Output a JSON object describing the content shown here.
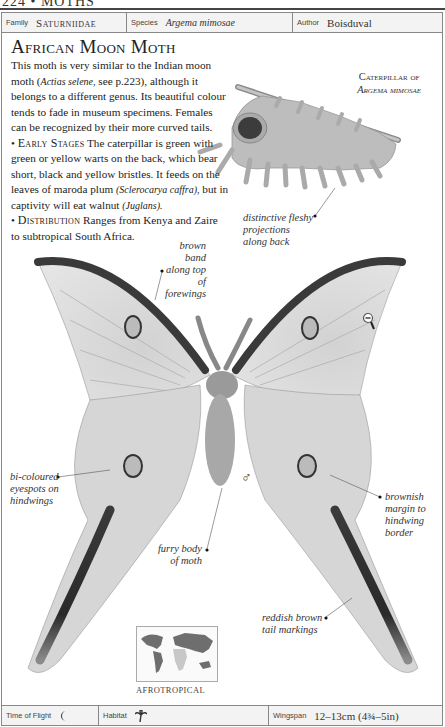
{
  "page": {
    "running_head": "224 • MOTHS"
  },
  "info_top": {
    "family_label": "Family",
    "family_value": "Saturniidae",
    "species_label": "Species",
    "species_value": "Argema mimosae",
    "author_label": "Author",
    "author_value": "Boisduval"
  },
  "entry": {
    "title": "African Moon Moth",
    "intro_1": "This moth is very similar to the Indian moon moth (",
    "intro_species": "Actias selene,",
    "intro_2": " see p.223), although it belongs to a different genus. Its beautiful colour tends to fade in museum specimens. Females can be recognized by their more curved tails.",
    "early_head": "Early Stages",
    "early_1": " The caterpillar is green with green or yellow warts on the back, which bear short, black and yellow bristles. It feeds on the leaves of maroda plum ",
    "early_plant": "(Sclerocarya caffra),",
    "early_2": " but in captivity will eat walnut ",
    "early_walnut": "(Juglans).",
    "dist_head": "Distribution",
    "dist_text": " Ranges from Kenya and Zaire to subtropical South Africa."
  },
  "caterpillar_caption": {
    "line1": "Caterpillar of",
    "line2": "Argema mimosae"
  },
  "annotations": {
    "fleshy": [
      "distinctive fleshy",
      "projections",
      "along back"
    ],
    "brown_band": [
      "brown band",
      "along top of",
      "forewings"
    ],
    "eyespots": [
      "bi-coloured",
      "eyespots on",
      "hindwings"
    ],
    "margin": [
      "brownish",
      "margin to",
      "hindwing",
      "border"
    ],
    "body": [
      "furry body",
      "of moth"
    ],
    "tail": [
      "reddish brown",
      "tail markings"
    ]
  },
  "symbols": {
    "sex": "♂",
    "size_icon": "magnifier-minus-icon"
  },
  "distribution_map": {
    "region": "AFROTROPICAL",
    "highlight_color": "#c8c8c8",
    "land_color": "#6e6e6e"
  },
  "info_bottom": {
    "flight_label": "Time of Flight",
    "flight_icon": "moon-icon",
    "habitat_label": "Habitat",
    "habitat_icon": "palm-tree-icon",
    "wingspan_label": "Wingspan",
    "wingspan_value": "12–13cm (4¾–5in)"
  }
}
